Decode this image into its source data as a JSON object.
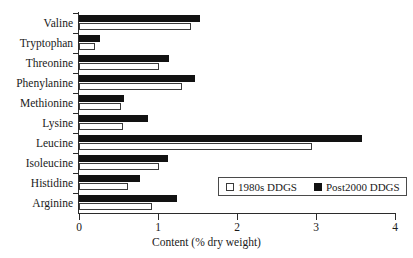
{
  "chart_data": {
    "type": "bar",
    "orientation": "horizontal",
    "title": "",
    "xlabel": "Content (% dry weight)",
    "ylabel": "",
    "xlim": [
      0,
      4
    ],
    "xticks": [
      "0",
      "1",
      "2",
      "3",
      "4"
    ],
    "grid": false,
    "legend_position": "inside-bottom-right",
    "categories": [
      "Valine",
      "Tryptophan",
      "Threonine",
      "Phenylanine",
      "Methionine",
      "Lysine",
      "Leucine",
      "Isoleucine",
      "Histidine",
      "Arginine"
    ],
    "series": [
      {
        "name": "1980s DDGS",
        "color": "#ffffff",
        "edge_color": "#3a3a3a",
        "values": [
          1.42,
          0.2,
          1.01,
          1.3,
          0.53,
          0.56,
          2.95,
          1.01,
          0.62,
          0.92
        ]
      },
      {
        "name": "Post2000 DDGS",
        "color": "#121212",
        "edge_color": "#121212",
        "values": [
          1.53,
          0.27,
          1.14,
          1.47,
          0.57,
          0.87,
          3.58,
          1.13,
          0.77,
          1.24
        ]
      }
    ]
  }
}
